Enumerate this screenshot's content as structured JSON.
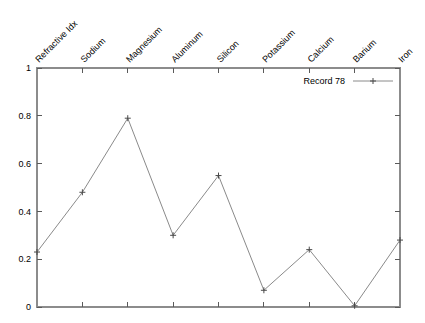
{
  "chart_data": {
    "type": "line",
    "title": "",
    "xlabel": "",
    "ylabel": "",
    "categories": [
      "Refractive Idx",
      "Sodium",
      "Magnesium",
      "Aluminum",
      "Silicon",
      "Potassium",
      "Calcium",
      "Barium",
      "Iron"
    ],
    "series": [
      {
        "name": "Record 78",
        "values": [
          0.23,
          0.48,
          0.79,
          0.3,
          0.55,
          0.07,
          0.24,
          0.005,
          0.28
        ]
      }
    ],
    "ylim": [
      0,
      1
    ],
    "ytick_labels": [
      "0",
      "0.2",
      "0.4",
      "0.6",
      "0.8",
      "1"
    ],
    "ytick_values": [
      0,
      0.2,
      0.4,
      0.6,
      0.8,
      1
    ],
    "grid": false,
    "legend_position": "top-right",
    "xaxis_label_position": "top",
    "xaxis_label_rotation": -45,
    "marker": "plus",
    "colors": {
      "line": "#8a8a8a",
      "marker": "#4a4a4a",
      "frame": "#8c8c8c",
      "tick": "#5a5a5a",
      "text": "#000000",
      "background": "#ffffff"
    }
  },
  "legend": {
    "entries": [
      {
        "label": "Record 78"
      }
    ]
  }
}
